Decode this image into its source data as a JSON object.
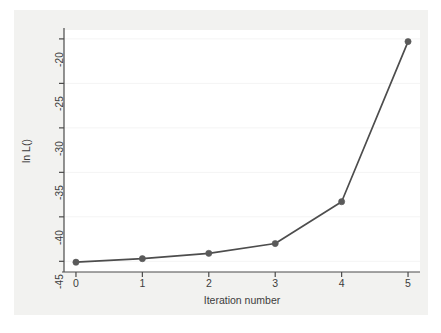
{
  "chart_data": {
    "type": "line",
    "title": "",
    "subtitle": "",
    "xlabel": "Iteration number",
    "ylabel": "ln L()",
    "x": [
      0,
      1,
      2,
      3,
      4,
      5
    ],
    "xtick_labels": [
      "0",
      "1",
      "2",
      "3",
      "4",
      "5"
    ],
    "ytick_labels": [
      "-20",
      "-25",
      "-30",
      "-35",
      "-40",
      "-45"
    ],
    "ytick_values": [
      -20,
      -25,
      -30,
      -35,
      -40,
      -45
    ],
    "xlim": [
      -0.18,
      5.18
    ],
    "ylim": [
      -46.2,
      -19.0
    ],
    "grid": true,
    "grid_axis": "y",
    "legend": "none",
    "markers": "filled-circle",
    "series": [
      {
        "name": "ln L()",
        "color": "#4d4d4d",
        "values": [
          -45.1,
          -44.7,
          -44.1,
          -43.0,
          -38.3,
          -20.3
        ]
      }
    ],
    "annotations": []
  },
  "colors": {
    "graph_background": "#f2f2f0",
    "plot_background": "#ffffff",
    "line": "#4d4d4d",
    "marker": "#5a5a5a",
    "axis": "#4a4a4a",
    "gridline": "#f4f4f4",
    "text": "#3c3c3c"
  }
}
